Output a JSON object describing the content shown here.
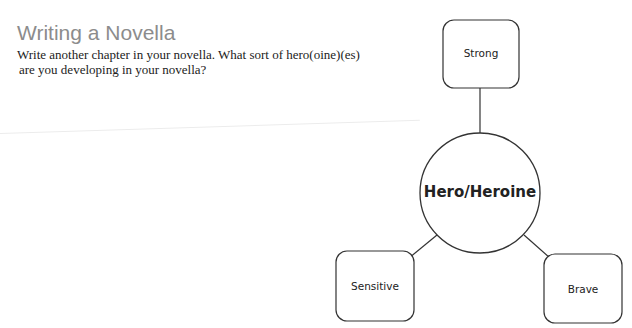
{
  "header": {
    "title": "Writing a Novella",
    "prompt_line1": "Write another chapter in your novella. What sort of hero(oine)(es)",
    "prompt_line2": "are you developing in your novella?"
  },
  "diagram": {
    "center": {
      "label": "Hero/Heroine",
      "cx": 480,
      "cy": 193,
      "r": 60
    },
    "nodes": [
      {
        "id": "strong",
        "label": "Strong",
        "x": 443,
        "y": 20,
        "w": 76,
        "h": 68
      },
      {
        "id": "sensitive",
        "label": "Sensitive",
        "x": 336,
        "y": 251,
        "w": 78,
        "h": 70
      },
      {
        "id": "brave",
        "label": "Brave",
        "x": 544,
        "y": 254,
        "w": 78,
        "h": 69
      }
    ],
    "stroke_color": "#333333"
  }
}
